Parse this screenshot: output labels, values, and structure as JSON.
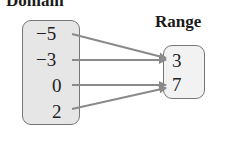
{
  "diagram": {
    "domain_title": "Domain",
    "range_title": "Range",
    "domain": [
      "−5",
      "−3",
      "0",
      "2"
    ],
    "range": [
      "3",
      "7"
    ],
    "mapping": [
      {
        "from": "−5",
        "to": "3"
      },
      {
        "from": "−3",
        "to": "3"
      },
      {
        "from": "0",
        "to": "7"
      },
      {
        "from": "2",
        "to": "7"
      }
    ],
    "colors": {
      "arrow": "#8a8a8a",
      "box_fill": "#e6e6e6",
      "box_border": "#777777"
    }
  }
}
